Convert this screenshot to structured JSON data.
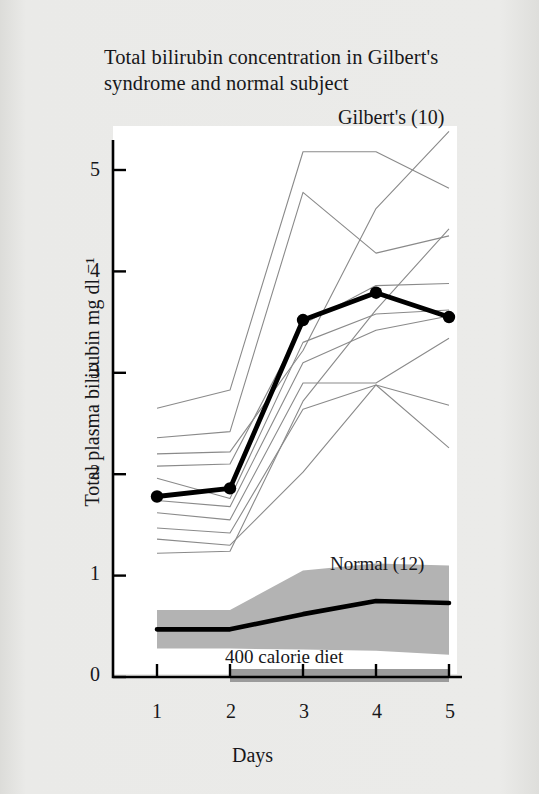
{
  "figure": {
    "title": "Total bilirubin concentration in Gilbert's syndrome and normal subject",
    "title_line1": "Total bilirubin concentration in Gilbert's",
    "title_line2": "syndrome and normal subject",
    "xlabel": "Days",
    "ylabel": "Total plasma bilirubin  mg dl ⁻¹",
    "gilberts_label": "Gilbert's (10)",
    "normal_label": "Normal (12)",
    "diet_label": "400 calorie diet",
    "page_background": "#e9e9e7",
    "plot_background": "#ffffff",
    "band_color": "#b3b3b3",
    "diet_bar_color": "#9b9b9b",
    "thin_line_color": "#8a8a8a",
    "bold_line_color": "#000000"
  },
  "axes": {
    "y_ticks": [
      "0",
      "1",
      "2",
      "3",
      "4",
      "5"
    ],
    "x_ticks": [
      "1",
      "2",
      "3",
      "4",
      "5"
    ],
    "ylim": [
      0,
      5.45
    ],
    "xlim": [
      0.6,
      5.35
    ]
  },
  "chart_data": {
    "type": "line",
    "title": "Total bilirubin concentration in Gilbert's syndrome and normal subject",
    "xlabel": "Days",
    "ylabel": "Total plasma bilirubin mg dl -1",
    "x": [
      1,
      2,
      3,
      4,
      5
    ],
    "ylim": [
      0,
      5.45
    ],
    "xlim": [
      0.6,
      5.35
    ],
    "grid": false,
    "legend_position": "inside-labels",
    "annotations": [
      "Gilbert's (10)",
      "Normal (12)",
      "400 calorie diet"
    ],
    "series": [
      {
        "name": "Gilbert's mean (10)",
        "style": "bold-line-with-markers",
        "values": [
          1.78,
          1.86,
          3.52,
          3.79,
          3.55
        ]
      },
      {
        "name": "Normal mean (12)",
        "style": "bold-line",
        "values": [
          0.47,
          0.47,
          0.62,
          0.75,
          0.73
        ]
      },
      {
        "name": "Normal range upper (12)",
        "style": "band-upper",
        "values": [
          0.66,
          0.66,
          1.05,
          1.12,
          1.1
        ]
      },
      {
        "name": "Normal range lower (12)",
        "style": "band-lower",
        "values": [
          0.28,
          0.28,
          0.27,
          0.26,
          0.22
        ]
      }
    ],
    "individual_gilberts": [
      {
        "name": "subject-1",
        "values": [
          2.65,
          2.83,
          5.18,
          5.18,
          4.82
        ]
      },
      {
        "name": "subject-2",
        "values": [
          2.36,
          2.42,
          4.78,
          4.18,
          4.35
        ]
      },
      {
        "name": "subject-3",
        "values": [
          2.2,
          2.22,
          3.22,
          4.62,
          5.38
        ]
      },
      {
        "name": "subject-4",
        "values": [
          2.08,
          2.1,
          3.48,
          3.86,
          3.88
        ]
      },
      {
        "name": "subject-5",
        "values": [
          1.96,
          1.76,
          3.3,
          3.58,
          3.62
        ]
      },
      {
        "name": "subject-6",
        "values": [
          1.74,
          1.68,
          3.1,
          3.42,
          3.56
        ]
      },
      {
        "name": "subject-7",
        "values": [
          1.62,
          1.55,
          2.9,
          2.9,
          3.34
        ]
      },
      {
        "name": "subject-8",
        "values": [
          1.47,
          1.42,
          2.64,
          2.88,
          2.68
        ]
      },
      {
        "name": "subject-9",
        "values": [
          1.36,
          1.3,
          2.02,
          2.88,
          2.26
        ]
      },
      {
        "name": "subject-10",
        "values": [
          1.22,
          1.24,
          2.72,
          3.62,
          4.42
        ]
      }
    ],
    "diet_period": {
      "label": "400 calorie diet",
      "start_day": 2,
      "end_day": 5
    }
  }
}
